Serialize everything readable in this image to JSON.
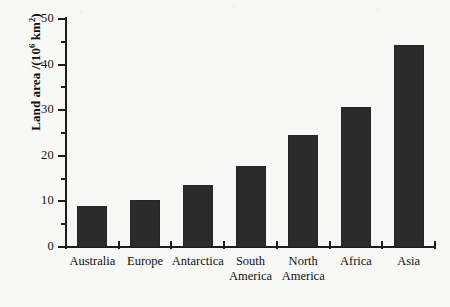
{
  "chart_data": {
    "type": "bar",
    "title": "",
    "subtitle": "",
    "xlabel": "",
    "ylabel": "Land area /(10⁶ km²)",
    "ylabel_parts": {
      "prefix": "Land area /(10",
      "exponent1": "6",
      "middle": " km",
      "exponent2": "2",
      "suffix": ")"
    },
    "categories": [
      "Australia",
      "Europe",
      "Antarctica",
      "South\nAmerica",
      "North\nAmerica",
      "Africa",
      "Asia"
    ],
    "values": [
      8.9,
      10.2,
      13.6,
      17.8,
      24.6,
      30.7,
      44.3
    ],
    "ylim": [
      0,
      50
    ],
    "ytick_values": [
      0,
      10,
      20,
      30,
      40,
      50
    ],
    "ytick_labels": [
      "0",
      "10",
      "20",
      "30",
      "40",
      "50"
    ],
    "yminor_values": [
      5,
      15,
      25,
      35,
      45
    ],
    "grid": false,
    "legend": false,
    "legend_position": "none",
    "bar_color": "#2b2b2b",
    "axis_color": "#1d1d1d",
    "background_color": "#f8f8f6"
  }
}
